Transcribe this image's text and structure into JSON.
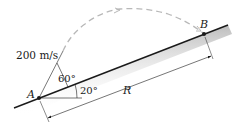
{
  "diagram": {
    "type": "projectile-on-incline",
    "labels": {
      "velocity": "200 m/s",
      "launch_angle": "60°",
      "incline_angle": "20°",
      "start_point": "A",
      "end_point": "B",
      "range": "R"
    },
    "colors": {
      "line": "#1a1a1a",
      "trajectory": "#b8b8b8",
      "ground_shade": "#c8c8c8"
    }
  }
}
